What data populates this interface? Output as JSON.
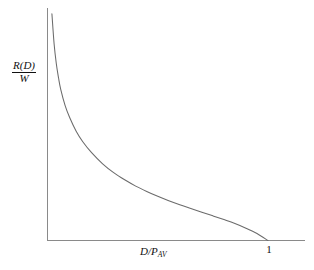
{
  "figure": {
    "background_color": "#ffffff",
    "axis_color": "#8a8a8a",
    "curve_color": "#6b6b6b",
    "text_color": "#111111"
  },
  "labels": {
    "ylabel_numerator": "R(D)",
    "ylabel_denominator": "W",
    "xlabel_main": "D/P",
    "xlabel_subscript": "AV",
    "xtick_one": "1"
  },
  "chart_data": {
    "type": "line",
    "title": "",
    "subtitle": "",
    "xlabel": "D/P_AV",
    "ylabel": "R(D)/W",
    "grid": false,
    "legend": null,
    "xlim": [
      0,
      1.25
    ],
    "ylim": [
      0,
      1.0
    ],
    "xticks": [
      1
    ],
    "xticklabels": [
      "1"
    ],
    "yticks": [],
    "yticklabels": [],
    "annotations": [],
    "series": [
      {
        "name": "R(D)/W",
        "comment": "Convex decreasing rate-distortion curve; rises steeply near x=0 and meets the x-axis at x=1.",
        "x": [
          0.02,
          0.03,
          0.04,
          0.05,
          0.06,
          0.08,
          0.1,
          0.13,
          0.16,
          0.2,
          0.25,
          0.3,
          0.35,
          0.4,
          0.45,
          0.5,
          0.55,
          0.6,
          0.65,
          0.7,
          0.75,
          0.8,
          0.85,
          0.9,
          0.95,
          1.0
        ],
        "y": [
          0.975,
          0.845,
          0.76,
          0.7,
          0.65,
          0.58,
          0.53,
          0.47,
          0.425,
          0.378,
          0.33,
          0.292,
          0.261,
          0.234,
          0.211,
          0.19,
          0.171,
          0.154,
          0.138,
          0.122,
          0.106,
          0.09,
          0.073,
          0.053,
          0.03,
          0.0
        ]
      }
    ]
  }
}
